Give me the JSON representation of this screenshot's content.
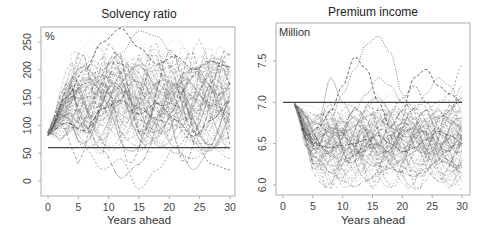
{
  "chart_data": [
    {
      "type": "line",
      "title": "Solvency ratio",
      "xlabel": "Years ahead",
      "ylabel": "%",
      "unit_label": "%",
      "x_ticks": [
        0,
        5,
        10,
        15,
        20,
        25,
        30
      ],
      "y_ticks": [
        0,
        50,
        100,
        150,
        200,
        250
      ],
      "xlim": [
        0,
        30
      ],
      "ylim": [
        -25,
        290
      ],
      "grid": false,
      "legend": null,
      "reference_line": {
        "y": 60,
        "label": "minimum solvency level"
      },
      "start_value": 85,
      "description": "Fan of ~100 simulated stochastic paths starting near 85% at year 0, rising to ~100-180 by year 5, spreading widely (about -15 to 275) over 30 years",
      "series": [
        {
          "name": "path-1",
          "x": [
            0,
            3,
            6,
            9,
            12,
            15,
            18,
            21,
            24,
            27,
            30
          ],
          "y": [
            85,
            150,
            200,
            250,
            275,
            240,
            210,
            225,
            200,
            215,
            205
          ]
        },
        {
          "name": "path-2",
          "x": [
            0,
            3,
            6,
            9,
            12,
            15,
            18,
            21,
            24,
            27,
            30
          ],
          "y": [
            85,
            140,
            185,
            200,
            230,
            270,
            260,
            220,
            195,
            160,
            140
          ]
        },
        {
          "name": "path-3",
          "x": [
            0,
            3,
            6,
            9,
            12,
            15,
            18,
            21,
            24,
            27,
            30
          ],
          "y": [
            85,
            120,
            100,
            55,
            5,
            30,
            80,
            130,
            160,
            140,
            120
          ]
        },
        {
          "name": "path-4",
          "x": [
            0,
            3,
            6,
            9,
            12,
            15,
            18,
            21,
            24,
            27,
            30
          ],
          "y": [
            85,
            110,
            60,
            20,
            40,
            -15,
            20,
            60,
            90,
            60,
            40
          ]
        },
        {
          "name": "path-5",
          "x": [
            0,
            3,
            6,
            9,
            12,
            15,
            18,
            21,
            24,
            27,
            30
          ],
          "y": [
            85,
            130,
            150,
            160,
            140,
            110,
            90,
            120,
            150,
            130,
            110
          ]
        },
        {
          "name": "path-6",
          "x": [
            0,
            3,
            6,
            9,
            12,
            15,
            18,
            21,
            24,
            27,
            30
          ],
          "y": [
            85,
            125,
            95,
            110,
            160,
            150,
            100,
            60,
            20,
            60,
            110
          ]
        },
        {
          "name": "path-7",
          "x": [
            0,
            3,
            6,
            9,
            12,
            15,
            18,
            21,
            24,
            27,
            30
          ],
          "y": [
            85,
            115,
            130,
            100,
            80,
            100,
            140,
            170,
            175,
            150,
            130
          ]
        },
        {
          "name": "path-8",
          "x": [
            0,
            3,
            6,
            9,
            12,
            15,
            18,
            21,
            24,
            27,
            30
          ],
          "y": [
            85,
            135,
            170,
            150,
            120,
            90,
            70,
            50,
            40,
            60,
            80
          ]
        },
        {
          "name": "path-9",
          "x": [
            0,
            3,
            6,
            9,
            12,
            15,
            18,
            21,
            24,
            27,
            30
          ],
          "y": [
            85,
            105,
            90,
            130,
            145,
            120,
            140,
            110,
            80,
            110,
            145
          ]
        },
        {
          "name": "path-10",
          "x": [
            0,
            3,
            6,
            9,
            12,
            15,
            18,
            21,
            24,
            27,
            30
          ],
          "y": [
            85,
            145,
            175,
            190,
            165,
            130,
            110,
            100,
            70,
            30,
            20
          ]
        }
      ]
    },
    {
      "type": "line",
      "title": "Premium income",
      "xlabel": "Years ahead",
      "ylabel": "Million",
      "unit_label": "Million",
      "x_ticks": [
        0,
        5,
        10,
        15,
        20,
        25,
        30
      ],
      "y_ticks": [
        6.0,
        6.5,
        7.0,
        7.5
      ],
      "y_tick_labels": [
        "6.0",
        "6.5",
        "7.0",
        "7.5"
      ],
      "xlim": [
        0,
        30
      ],
      "ylim": [
        5.95,
        7.85
      ],
      "grid": false,
      "legend": null,
      "reference_line": {
        "y": 7.0,
        "x_start": 0,
        "x_end": 30
      },
      "start_value": 6.97,
      "description": "Fan of ~100 simulated paths starting near 6.97 at year 2, dropping to ~6.4-6.8 by year 5, then spreading between ~5.98 and ~7.8 through year 30",
      "series": [
        {
          "name": "path-1",
          "x": [
            2,
            4,
            6,
            8,
            10,
            12,
            14,
            16,
            18,
            20,
            22,
            24,
            26,
            28,
            30
          ],
          "y": [
            6.97,
            6.6,
            6.7,
            6.9,
            7.2,
            7.55,
            7.4,
            7.0,
            6.7,
            6.9,
            7.3,
            7.4,
            7.2,
            7.1,
            7.0
          ]
        },
        {
          "name": "path-2",
          "x": [
            2,
            4,
            6,
            8,
            10,
            12,
            14,
            16,
            18,
            20,
            22,
            24,
            26,
            28,
            30
          ],
          "y": [
            6.97,
            6.55,
            6.5,
            6.8,
            7.1,
            7.4,
            7.7,
            7.8,
            7.6,
            7.1,
            6.8,
            6.6,
            6.7,
            6.9,
            7.2
          ]
        },
        {
          "name": "path-3",
          "x": [
            2,
            4,
            6,
            8,
            10,
            12,
            14,
            16,
            18,
            20,
            22,
            24,
            26,
            28,
            30
          ],
          "y": [
            6.97,
            6.45,
            6.3,
            6.15,
            6.05,
            5.98,
            6.05,
            6.15,
            6.2,
            6.15,
            6.1,
            6.2,
            6.3,
            6.25,
            6.15
          ]
        },
        {
          "name": "path-4",
          "x": [
            2,
            4,
            6,
            8,
            10,
            12,
            14,
            16,
            18,
            20,
            22,
            24,
            26,
            28,
            30
          ],
          "y": [
            6.97,
            6.6,
            6.55,
            6.5,
            6.45,
            6.4,
            6.45,
            6.5,
            6.6,
            6.7,
            6.8,
            6.9,
            7.0,
            7.1,
            7.45
          ]
        },
        {
          "name": "path-5",
          "x": [
            2,
            4,
            6,
            8,
            10,
            12,
            14,
            16,
            18,
            20,
            22,
            24,
            26,
            28,
            30
          ],
          "y": [
            6.97,
            6.65,
            6.6,
            6.7,
            6.55,
            6.4,
            6.35,
            6.5,
            6.7,
            6.9,
            6.8,
            6.6,
            6.5,
            6.55,
            6.6
          ]
        },
        {
          "name": "path-6",
          "x": [
            2,
            4,
            6,
            8,
            10,
            12,
            14,
            16,
            18,
            20,
            22,
            24,
            26,
            28,
            30
          ],
          "y": [
            6.97,
            6.7,
            6.8,
            7.3,
            7.0,
            6.8,
            6.6,
            6.4,
            6.3,
            6.4,
            6.6,
            6.8,
            6.9,
            6.75,
            6.7
          ]
        },
        {
          "name": "path-7",
          "x": [
            2,
            4,
            6,
            8,
            10,
            12,
            14,
            16,
            18,
            20,
            22,
            24,
            26,
            28,
            30
          ],
          "y": [
            6.97,
            6.5,
            6.45,
            6.4,
            6.5,
            6.6,
            6.5,
            6.35,
            6.25,
            6.3,
            6.4,
            6.5,
            6.45,
            6.35,
            6.3
          ]
        },
        {
          "name": "path-8",
          "x": [
            2,
            4,
            6,
            8,
            10,
            12,
            14,
            16,
            18,
            20,
            22,
            24,
            26,
            28,
            30
          ],
          "y": [
            6.97,
            6.62,
            6.58,
            6.65,
            6.75,
            6.9,
            7.1,
            7.3,
            7.2,
            7.0,
            6.9,
            7.1,
            7.3,
            7.2,
            6.9
          ]
        },
        {
          "name": "path-9",
          "x": [
            2,
            4,
            6,
            8,
            10,
            12,
            14,
            16,
            18,
            20,
            22,
            24,
            26,
            28,
            30
          ],
          "y": [
            6.97,
            6.55,
            6.48,
            6.45,
            6.48,
            6.5,
            6.55,
            6.6,
            6.5,
            6.4,
            6.45,
            6.55,
            6.65,
            6.6,
            6.5
          ]
        },
        {
          "name": "path-10",
          "x": [
            2,
            4,
            6,
            8,
            10,
            12,
            14,
            16,
            18,
            20,
            22,
            24,
            26,
            28,
            30
          ],
          "y": [
            6.97,
            6.6,
            6.5,
            6.35,
            6.3,
            6.35,
            6.5,
            6.7,
            6.9,
            7.05,
            7.2,
            7.0,
            6.8,
            6.9,
            7.05
          ]
        }
      ]
    }
  ]
}
